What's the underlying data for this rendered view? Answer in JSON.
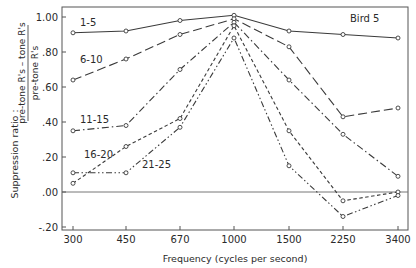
{
  "chart_data": {
    "type": "line",
    "title": "",
    "annotation": "Bird 5",
    "xlabel": "Frequency (cycles per second)",
    "ylabel_prefix": "Suppression ratio :",
    "ylabel_numerator": "pre-tone R's – tone R's",
    "ylabel_denominator": "pre-tone R's",
    "categories": [
      "300",
      "450",
      "670",
      "1000",
      "1500",
      "2250",
      "3400"
    ],
    "yticks": [
      1.0,
      0.8,
      0.6,
      0.4,
      0.2,
      0.0,
      -0.2
    ],
    "ytick_labels": [
      "1.00",
      ".80",
      ".60",
      ".40",
      ".20",
      ".00",
      "-.20"
    ],
    "ylim": [
      -0.2,
      1.0
    ],
    "grid": false,
    "zero_line": true,
    "legend_position": "inline labels near left of each curve",
    "series": [
      {
        "name": "1-5",
        "style": "solid",
        "values": [
          0.91,
          0.92,
          0.98,
          1.01,
          0.92,
          0.9,
          0.88
        ]
      },
      {
        "name": "6-10",
        "style": "long-dash",
        "values": [
          0.64,
          0.76,
          0.9,
          0.99,
          0.83,
          0.43,
          0.48
        ]
      },
      {
        "name": "11-15",
        "style": "dash-dot",
        "values": [
          0.35,
          0.38,
          0.7,
          0.97,
          0.64,
          0.33,
          0.09
        ]
      },
      {
        "name": "16-20",
        "style": "short-dash",
        "values": [
          0.05,
          0.26,
          0.42,
          0.95,
          0.35,
          -0.05,
          0.0
        ]
      },
      {
        "name": "21-25",
        "style": "dash-dot-dot",
        "values": [
          0.11,
          0.11,
          0.37,
          0.88,
          0.15,
          -0.14,
          -0.02
        ]
      }
    ]
  },
  "colors": {
    "line": "#3a3a3a",
    "axis": "#555555",
    "background": "#ffffff"
  }
}
